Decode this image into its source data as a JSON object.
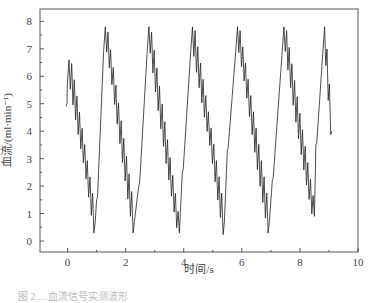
{
  "chart_data": {
    "type": "line",
    "title": "",
    "xlabel": "时间/s",
    "ylabel": "血流/(ml·min⁻¹)",
    "xlim": [
      -0.95,
      10
    ],
    "ylim": [
      -0.4,
      8.45
    ],
    "xticks": [
      0,
      2,
      4,
      6,
      8,
      10
    ],
    "yticks": [
      0,
      1,
      2,
      3,
      4,
      5,
      6,
      7,
      8
    ],
    "grid": false,
    "legend": null,
    "series": [
      {
        "name": "血流",
        "color": "#222222",
        "description": "Pulsatile sawtooth-like blood flow waveform with high-frequency oscillation; ~6 cycles, period ≈1.55 s",
        "start_x": 0.0,
        "end_x": 9.1,
        "end_value": 4.0,
        "cycles": [
          {
            "rise_start_x": -0.05,
            "rise_from": 4.9,
            "peak_x": 0.05,
            "peak": 6.6,
            "trough_x": 0.95,
            "trough": 0.7
          },
          {
            "rise_start_x": 1.0,
            "rise_from": 1.5,
            "peak_x": 1.3,
            "peak": 7.8,
            "trough_x": 2.3,
            "trough": 0.7
          },
          {
            "rise_start_x": 2.45,
            "rise_from": 2.0,
            "peak_x": 2.8,
            "peak": 7.8,
            "trough_x": 3.85,
            "trough": 0.3
          },
          {
            "rise_start_x": 3.95,
            "rise_from": 2.5,
            "peak_x": 4.3,
            "peak": 7.8,
            "trough_x": 5.4,
            "trough": 0.7
          },
          {
            "rise_start_x": 5.5,
            "rise_from": 3.3,
            "peak_x": 5.85,
            "peak": 7.8,
            "trough_x": 6.95,
            "trough": 0.7
          },
          {
            "rise_start_x": 7.05,
            "rise_from": 2.2,
            "peak_x": 7.45,
            "peak": 7.8,
            "trough_x": 8.5,
            "trough": 0.9
          },
          {
            "rise_start_x": 8.55,
            "rise_from": 3.5,
            "peak_x": 8.85,
            "peak": 7.8,
            "trough_x": 9.1,
            "trough": 4.0
          }
        ],
        "oscillation_amplitude": 1.3,
        "oscillation_period_s": 0.09
      }
    ]
  },
  "caption": "图 2 …血流信号实测波形"
}
